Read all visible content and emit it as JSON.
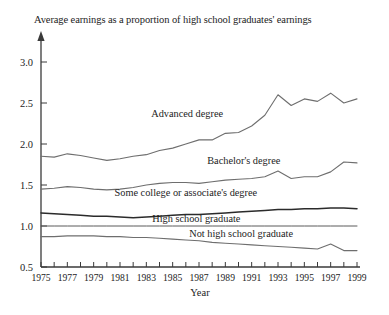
{
  "chart_data": {
    "type": "line",
    "title": "Average earnings as a proportion of high school graduates' earnings",
    "xlabel": "Year",
    "ylabel": "",
    "xlim": [
      1975,
      1999
    ],
    "ylim": [
      0.5,
      3.0
    ],
    "grid": false,
    "legend_position": "inline-labels",
    "y_ticks": [
      "3.0",
      "2.5",
      "2.0",
      "1.5",
      "1.0",
      "0.5"
    ],
    "y_tick_values": [
      3.0,
      2.5,
      2.0,
      1.5,
      1.0,
      0.5
    ],
    "x_ticks": [
      "1975",
      "1977",
      "1979",
      "1981",
      "1983",
      "1985",
      "1987",
      "1989",
      "1991",
      "1993",
      "1995",
      "1997",
      "1999"
    ],
    "x_tick_values": [
      1975,
      1977,
      1979,
      1981,
      1983,
      1985,
      1987,
      1989,
      1991,
      1993,
      1995,
      1997,
      1999
    ],
    "x_minor_ticks": [
      1975,
      1976,
      1977,
      1978,
      1979,
      1980,
      1981,
      1982,
      1983,
      1984,
      1985,
      1986,
      1987,
      1988,
      1989,
      1990,
      1991,
      1992,
      1993,
      1994,
      1995,
      1996,
      1997,
      1998,
      1999
    ],
    "x": [
      1975,
      1976,
      1977,
      1978,
      1979,
      1980,
      1981,
      1982,
      1983,
      1984,
      1985,
      1986,
      1987,
      1988,
      1989,
      1990,
      1991,
      1992,
      1993,
      1994,
      1995,
      1996,
      1997,
      1998,
      1999
    ],
    "series": [
      {
        "name": "Advanced degree",
        "label": "Advanced degree",
        "label_x": 1986.1,
        "label_y": 2.33,
        "color": "#6e6e6e",
        "values": [
          1.85,
          1.84,
          1.88,
          1.86,
          1.83,
          1.8,
          1.82,
          1.85,
          1.87,
          1.92,
          1.95,
          2.0,
          2.05,
          2.05,
          2.13,
          2.14,
          2.22,
          2.35,
          2.6,
          2.47,
          2.55,
          2.52,
          2.62,
          2.5,
          2.55
        ]
      },
      {
        "name": "Bachelor's degree",
        "label": "Bachelor's degree",
        "label_x": 1990.4,
        "label_y": 1.76,
        "color": "#6e6e6e",
        "values": [
          1.45,
          1.46,
          1.48,
          1.47,
          1.45,
          1.44,
          1.45,
          1.47,
          1.5,
          1.52,
          1.53,
          1.53,
          1.52,
          1.54,
          1.56,
          1.57,
          1.58,
          1.6,
          1.67,
          1.58,
          1.6,
          1.6,
          1.66,
          1.78,
          1.77
        ]
      },
      {
        "name": "Some college or associate's degree",
        "label": "Some college or associate's degree",
        "label_x": 1986.0,
        "label_y": 1.36,
        "color": "#6e6e6e",
        "values": [
          1.16,
          1.15,
          1.14,
          1.13,
          1.12,
          1.12,
          1.11,
          1.1,
          1.11,
          1.12,
          1.13,
          1.14,
          1.14,
          1.15,
          1.16,
          1.17,
          1.18,
          1.19,
          1.2,
          1.2,
          1.21,
          1.21,
          1.22,
          1.22,
          1.21
        ]
      },
      {
        "name": "High school graduate",
        "label": "High school graduate",
        "label_x": 1986.8,
        "label_y": 1.05,
        "color": "#2b2b2b",
        "values": [
          1.0,
          1.0,
          1.0,
          1.0,
          1.0,
          1.0,
          1.0,
          1.0,
          1.0,
          1.0,
          1.0,
          1.0,
          1.0,
          1.0,
          1.0,
          1.0,
          1.0,
          1.0,
          1.0,
          1.0,
          1.0,
          1.0,
          1.0,
          1.0,
          1.0
        ]
      },
      {
        "name": "Not high school graduate",
        "label": "Not high school graduate",
        "label_x": 1990.2,
        "label_y": 0.87,
        "color": "#6e6e6e",
        "values": [
          0.87,
          0.87,
          0.88,
          0.88,
          0.88,
          0.87,
          0.87,
          0.86,
          0.86,
          0.85,
          0.84,
          0.83,
          0.82,
          0.8,
          0.79,
          0.78,
          0.77,
          0.76,
          0.75,
          0.74,
          0.73,
          0.72,
          0.78,
          0.7,
          0.7
        ]
      }
    ]
  }
}
